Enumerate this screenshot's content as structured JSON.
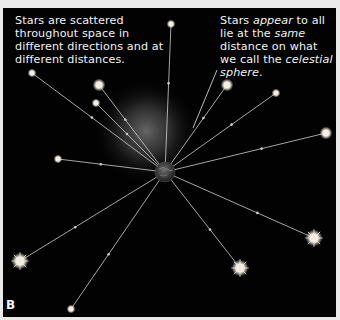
{
  "figure": {
    "panel_label": "B",
    "caption_left": "Stars are scattered throughout space in different directions and at different distances.",
    "caption_right": {
      "parts": [
        {
          "text": "Stars ",
          "italic": false
        },
        {
          "text": "appear",
          "italic": true
        },
        {
          "text": " to all lie at the ",
          "italic": false
        },
        {
          "text": "same",
          "italic": true
        },
        {
          "text": " distance on what we call the ",
          "italic": false
        },
        {
          "text": "celestial sphere",
          "italic": true
        },
        {
          "text": ".",
          "italic": false
        }
      ]
    },
    "colors": {
      "background": "#020202",
      "frame": "#e9e9e9",
      "text": "#f2f2f2",
      "star": "#f4efe6",
      "line": "#d8d8d8"
    },
    "observer": "earth",
    "stars": [
      {
        "id": "star-1",
        "style": "small"
      },
      {
        "id": "star-2",
        "style": "medium"
      },
      {
        "id": "star-3",
        "style": "small"
      },
      {
        "id": "star-4",
        "style": "small"
      },
      {
        "id": "star-5",
        "style": "medium"
      },
      {
        "id": "star-6",
        "style": "small"
      },
      {
        "id": "star-7",
        "style": "medium"
      },
      {
        "id": "star-8",
        "style": "small"
      },
      {
        "id": "star-9",
        "style": "burst"
      },
      {
        "id": "star-10",
        "style": "small"
      },
      {
        "id": "star-11",
        "style": "burst"
      },
      {
        "id": "star-12",
        "style": "burst"
      }
    ]
  }
}
